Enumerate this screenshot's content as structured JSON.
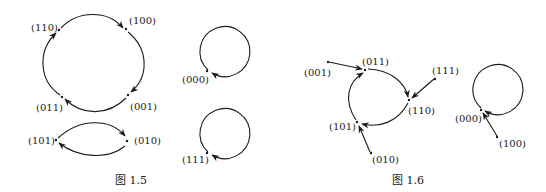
{
  "figures": [
    {
      "caption": "图 1.5",
      "nodes": [
        {
          "id": "110",
          "label": "(110)"
        },
        {
          "id": "100",
          "label": "(100)"
        },
        {
          "id": "001",
          "label": "(001)"
        },
        {
          "id": "011",
          "label": "(011)"
        },
        {
          "id": "101",
          "label": "(101)"
        },
        {
          "id": "010",
          "label": "(010)"
        },
        {
          "id": "000",
          "label": "(000)"
        },
        {
          "id": "111",
          "label": "(111)"
        }
      ],
      "edges": [
        {
          "from": "110",
          "to": "100"
        },
        {
          "from": "100",
          "to": "001"
        },
        {
          "from": "001",
          "to": "011"
        },
        {
          "from": "011",
          "to": "110"
        },
        {
          "from": "101",
          "to": "010"
        },
        {
          "from": "010",
          "to": "101"
        },
        {
          "from": "000",
          "to": "000"
        },
        {
          "from": "111",
          "to": "111"
        }
      ]
    },
    {
      "caption": "图 1.6",
      "nodes": [
        {
          "id": "001",
          "label": "(001)"
        },
        {
          "id": "011",
          "label": "(011)"
        },
        {
          "id": "111",
          "label": "(111)"
        },
        {
          "id": "110",
          "label": "(110)"
        },
        {
          "id": "101",
          "label": "(101)"
        },
        {
          "id": "010",
          "label": "(010)"
        },
        {
          "id": "000",
          "label": "(000)"
        },
        {
          "id": "100",
          "label": "(100)"
        }
      ],
      "edges": [
        {
          "from": "001",
          "to": "011"
        },
        {
          "from": "011",
          "to": "110"
        },
        {
          "from": "111",
          "to": "110"
        },
        {
          "from": "110",
          "to": "101"
        },
        {
          "from": "101",
          "to": "011"
        },
        {
          "from": "010",
          "to": "101"
        },
        {
          "from": "000",
          "to": "000"
        },
        {
          "from": "100",
          "to": "000"
        }
      ]
    }
  ]
}
